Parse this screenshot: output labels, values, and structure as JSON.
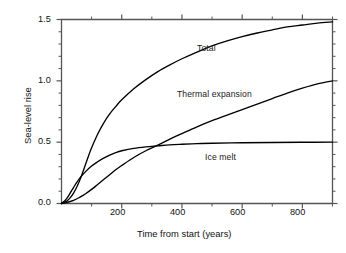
{
  "chart_data": {
    "type": "line",
    "title": "",
    "xlabel": "Time from start (years)",
    "ylabel": "Sea-level rise",
    "xlim": [
      0,
      900
    ],
    "ylim": [
      0.0,
      1.5
    ],
    "grid": false,
    "legend_position": "inline-annotations",
    "xticks": [
      200,
      400,
      600,
      800
    ],
    "xtick_labels": [
      "200",
      "400",
      "600",
      "800"
    ],
    "x_minor_step": 100,
    "yticks": [
      0.0,
      0.5,
      1.0,
      1.5
    ],
    "ytick_labels": [
      "0.0",
      "0.5",
      "1.0",
      "1.5"
    ],
    "y_minor_step": 0.1,
    "line_color": "#000000",
    "frame_color": "#555555",
    "series": [
      {
        "name": "Total",
        "label": "Total",
        "x": [
          0,
          10,
          20,
          30,
          40,
          50,
          60,
          70,
          80,
          90,
          100,
          120,
          140,
          160,
          180,
          200,
          240,
          280,
          320,
          360,
          400,
          450,
          500,
          550,
          600,
          650,
          700,
          750,
          800,
          850,
          900
        ],
        "values": [
          0.0,
          0.01,
          0.025,
          0.05,
          0.085,
          0.13,
          0.185,
          0.25,
          0.32,
          0.39,
          0.455,
          0.565,
          0.655,
          0.73,
          0.79,
          0.845,
          0.935,
          1.01,
          1.075,
          1.13,
          1.18,
          1.235,
          1.285,
          1.325,
          1.36,
          1.39,
          1.415,
          1.44,
          1.455,
          1.47,
          1.48
        ]
      },
      {
        "name": "Thermal expansion",
        "label": "Thermal expansion",
        "x": [
          0,
          20,
          40,
          60,
          80,
          100,
          120,
          140,
          160,
          180,
          200,
          240,
          280,
          320,
          360,
          400,
          450,
          500,
          550,
          600,
          650,
          700,
          750,
          800,
          850,
          900
        ],
        "values": [
          0.0,
          0.01,
          0.025,
          0.05,
          0.08,
          0.115,
          0.155,
          0.195,
          0.235,
          0.275,
          0.31,
          0.375,
          0.43,
          0.475,
          0.525,
          0.57,
          0.625,
          0.675,
          0.72,
          0.765,
          0.81,
          0.855,
          0.9,
          0.94,
          0.975,
          1.0
        ]
      },
      {
        "name": "Ice melt",
        "label": "Ice melt",
        "x": [
          0,
          10,
          20,
          30,
          40,
          50,
          60,
          80,
          100,
          120,
          140,
          160,
          180,
          200,
          240,
          280,
          320,
          360,
          400,
          450,
          500,
          600,
          700,
          800,
          900
        ],
        "values": [
          0.0,
          0.02,
          0.05,
          0.09,
          0.13,
          0.17,
          0.205,
          0.26,
          0.305,
          0.34,
          0.37,
          0.395,
          0.415,
          0.43,
          0.45,
          0.462,
          0.47,
          0.478,
          0.483,
          0.488,
          0.491,
          0.495,
          0.497,
          0.499,
          0.5
        ]
      }
    ],
    "annotations": [
      {
        "text": "Total",
        "x": 430,
        "y": 1.255
      },
      {
        "text": "Thermal expansion",
        "x": 430,
        "y": 0.88
      },
      {
        "text": "Ice melt",
        "x": 520,
        "y": 0.38
      }
    ]
  }
}
